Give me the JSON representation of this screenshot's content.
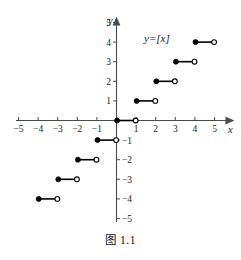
{
  "figure": {
    "caption": "图 1.1",
    "function_label": "y=[x]",
    "axis_x_name": "x",
    "axis_y_name": "y"
  },
  "chart_data": {
    "type": "line",
    "title": "",
    "subtitle": "",
    "function_label": "y=[x]",
    "xlabel": "x",
    "ylabel": "y",
    "xlim": [
      -5.6,
      5.6
    ],
    "ylim": [
      -5.6,
      5.6
    ],
    "grid": false,
    "legend": "none",
    "xticks": [
      -5,
      -4,
      -3,
      -2,
      -1,
      1,
      2,
      3,
      4,
      5
    ],
    "yticks": [
      5,
      4,
      3,
      2,
      1,
      -1,
      -2,
      -3,
      -4,
      -5
    ],
    "xtick_labels": [
      "−5",
      "−4",
      "−3",
      "−2",
      "−1",
      "1",
      "2",
      "3",
      "4",
      "5"
    ],
    "ytick_labels": [
      "5",
      "4",
      "3",
      "2",
      "1",
      "−1",
      "−2",
      "−3",
      "−4",
      "−5"
    ],
    "steps": [
      {
        "x_start": -4,
        "x_end": -3,
        "y": -4,
        "left_endpoint": "closed",
        "right_endpoint": "open"
      },
      {
        "x_start": -3,
        "x_end": -2,
        "y": -3,
        "left_endpoint": "closed",
        "right_endpoint": "open"
      },
      {
        "x_start": -2,
        "x_end": -1,
        "y": -2,
        "left_endpoint": "closed",
        "right_endpoint": "open"
      },
      {
        "x_start": -1,
        "x_end": 0,
        "y": -1,
        "left_endpoint": "closed",
        "right_endpoint": "open"
      },
      {
        "x_start": 0,
        "x_end": 1,
        "y": 0,
        "left_endpoint": "closed",
        "right_endpoint": "open"
      },
      {
        "x_start": 1,
        "x_end": 2,
        "y": 1,
        "left_endpoint": "closed",
        "right_endpoint": "open"
      },
      {
        "x_start": 2,
        "x_end": 3,
        "y": 2,
        "left_endpoint": "closed",
        "right_endpoint": "open"
      },
      {
        "x_start": 3,
        "x_end": 4,
        "y": 3,
        "left_endpoint": "closed",
        "right_endpoint": "open"
      },
      {
        "x_start": 4,
        "x_end": 5,
        "y": 4,
        "left_endpoint": "closed",
        "right_endpoint": "open"
      }
    ],
    "annotations": [
      {
        "text": "y=[x]",
        "x": 2.6,
        "y": 4.75
      }
    ],
    "colors": {
      "curve": "#000000",
      "axis": "#4a4a4a",
      "text": "#1a1a1a",
      "background": "#ffffff"
    }
  }
}
